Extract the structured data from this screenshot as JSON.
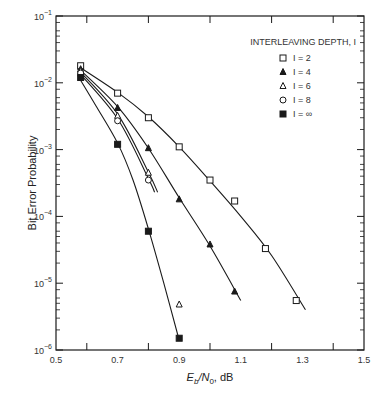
{
  "chart_data": {
    "type": "line",
    "title": "",
    "xlabel": "Eb/N0, dB",
    "ylabel": "Bit Error Probability",
    "xlim": [
      0.5,
      1.5
    ],
    "ylim": [
      1e-06,
      0.1
    ],
    "yscale": "log",
    "grid": false,
    "x_ticks": [
      "0.5",
      "0.7",
      "0.9",
      "1.1",
      "1.3",
      "1.5"
    ],
    "y_ticks": [
      "10-1",
      "10-2",
      "10-3",
      "10-4",
      "10-5",
      "10-6"
    ],
    "legend_title": "INTERLEAVING DEPTH, I",
    "legend_position": "upper right",
    "series": [
      {
        "name": "I = 2",
        "marker": "open-square",
        "x": [
          0.58,
          0.7,
          0.8,
          0.9,
          1.0,
          1.08,
          1.18,
          1.28
        ],
        "y": [
          0.018,
          0.007,
          0.003,
          0.0011,
          0.00035,
          0.00017,
          3.3e-05,
          5.5e-06
        ],
        "curve": [
          [
            0.57,
            0.018
          ],
          [
            0.7,
            0.0072
          ],
          [
            0.8,
            0.0031
          ],
          [
            0.9,
            0.0011
          ],
          [
            1.0,
            0.00034
          ],
          [
            1.1,
            0.0001
          ],
          [
            1.2,
            2.6e-05
          ],
          [
            1.31,
            4e-06
          ]
        ]
      },
      {
        "name": "I = 4",
        "marker": "filled-triangle",
        "x": [
          0.58,
          0.7,
          0.8,
          0.9,
          1.0,
          1.08
        ],
        "y": [
          0.016,
          0.0042,
          0.00105,
          0.00018,
          3.8e-05,
          7.5e-06
        ],
        "curve": [
          [
            0.57,
            0.017
          ],
          [
            0.7,
            0.0044
          ],
          [
            0.8,
            0.00105
          ],
          [
            0.9,
            0.00019
          ],
          [
            1.0,
            3.6e-05
          ],
          [
            1.1,
            5.5e-06
          ]
        ]
      },
      {
        "name": "I = 6",
        "marker": "open-triangle",
        "x": [
          0.58,
          0.7,
          0.8,
          0.9
        ],
        "y": [
          0.015,
          0.0032,
          0.00045,
          4.8e-06
        ],
        "curve": [
          [
            0.57,
            0.016
          ],
          [
            0.7,
            0.0034
          ],
          [
            0.8,
            0.00046
          ],
          [
            0.83,
            0.00023
          ]
        ]
      },
      {
        "name": "I = 8",
        "marker": "open-circle",
        "x": [
          0.58,
          0.7,
          0.8
        ],
        "y": [
          0.014,
          0.0027,
          0.00035
        ],
        "curve": [
          [
            0.57,
            0.015
          ],
          [
            0.7,
            0.0029
          ],
          [
            0.8,
            0.00037
          ],
          [
            0.82,
            0.00023
          ]
        ]
      },
      {
        "name": "I = ∞",
        "marker": "filled-square",
        "x": [
          0.58,
          0.7,
          0.8,
          0.9
        ],
        "y": [
          0.012,
          0.0012,
          6e-05,
          1.5e-06
        ],
        "curve": [
          [
            0.57,
            0.013
          ],
          [
            0.63,
            0.0045
          ],
          [
            0.7,
            0.00125
          ],
          [
            0.75,
            0.00035
          ],
          [
            0.8,
            6.5e-05
          ],
          [
            0.85,
            1e-05
          ],
          [
            0.9,
            1.4e-06
          ]
        ]
      }
    ]
  },
  "axes": {
    "xlabel_main": "E",
    "xlabel_sub1": "b",
    "xlabel_mid": "/N",
    "xlabel_sub2": "0",
    "xlabel_tail": ", dB",
    "ylabel": "Bit Error Probability"
  },
  "legend": {
    "title": "INTERLEAVING DEPTH, I",
    "items": [
      {
        "marker": "open-square",
        "label": "I = 2"
      },
      {
        "marker": "filled-triangle",
        "label": "I = 4"
      },
      {
        "marker": "open-triangle",
        "label": "I = 6"
      },
      {
        "marker": "open-circle",
        "label": "I = 8"
      },
      {
        "marker": "filled-square",
        "label": "I = ∞"
      }
    ]
  },
  "colors": {
    "ink": "#1a1a1a",
    "background": "#ffffff"
  }
}
